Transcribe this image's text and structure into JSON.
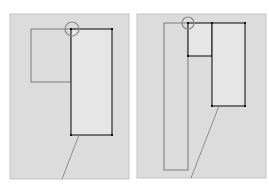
{
  "figure": {
    "width": 269,
    "height": 190,
    "background": "#ffffff",
    "panel_fill": "#dcdcdc",
    "panel_stroke": "#c4c4c4",
    "inner_fill": "#e6e6e6",
    "dark_stroke": "#2a2a2a",
    "light_stroke": "#7a7a7a",
    "marker_stroke": "#8a8a8a"
  },
  "panels": [
    {
      "id": "left",
      "frame": {
        "x": 10,
        "y": 14,
        "w": 119,
        "h": 165
      },
      "light_rects": [
        {
          "x": 31,
          "y": 29,
          "w": 40,
          "h": 53
        }
      ],
      "dark_rects": [
        {
          "x": 71,
          "y": 29,
          "w": 41,
          "h": 106
        }
      ],
      "lines": [
        {
          "x1": 79,
          "y1": 135,
          "x2": 62,
          "y2": 179
        }
      ],
      "marker_circle": {
        "cx": 72,
        "cy": 29,
        "r": 7
      }
    },
    {
      "id": "right",
      "frame": {
        "x": 137,
        "y": 14,
        "w": 129,
        "h": 164
      },
      "light_rects": [
        {
          "x": 164,
          "y": 23,
          "w": 24,
          "h": 147
        }
      ],
      "dark_rects": [
        {
          "x": 188,
          "y": 23,
          "w": 24,
          "h": 33
        },
        {
          "x": 212,
          "y": 23,
          "w": 33,
          "h": 83
        }
      ],
      "lines": [
        {
          "x1": 219,
          "y1": 106,
          "x2": 191,
          "y2": 178
        }
      ],
      "marker_circle": {
        "cx": 188,
        "cy": 23,
        "r": 6
      }
    }
  ]
}
